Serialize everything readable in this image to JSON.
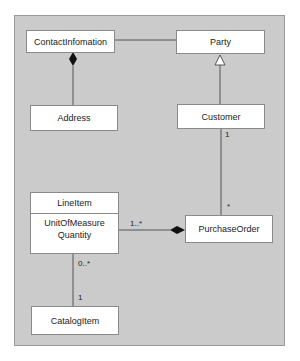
{
  "diagram": {
    "type": "UML class diagram",
    "classes": [
      {
        "id": "contact",
        "name": "ContactInfomation",
        "attributes": []
      },
      {
        "id": "party",
        "name": "Party",
        "attributes": []
      },
      {
        "id": "address",
        "name": "Address",
        "attributes": []
      },
      {
        "id": "customer",
        "name": "Customer",
        "attributes": []
      },
      {
        "id": "lineitem",
        "name": "LineItem",
        "attributes": [
          "UnitOfMeasure",
          "Quantity"
        ]
      },
      {
        "id": "purchaseorder",
        "name": "PurchaseOrder",
        "attributes": []
      },
      {
        "id": "catalogitem",
        "name": "CatalogItem",
        "attributes": []
      }
    ],
    "relationships": [
      {
        "from": "ContactInfomation",
        "to": "Party",
        "kind": "association"
      },
      {
        "from": "Address",
        "to": "ContactInfomation",
        "kind": "composition"
      },
      {
        "from": "Customer",
        "to": "Party",
        "kind": "generalization"
      },
      {
        "from": "Customer",
        "to": "PurchaseOrder",
        "kind": "association",
        "from_mult": "1",
        "to_mult": "*"
      },
      {
        "from": "LineItem",
        "to": "PurchaseOrder",
        "kind": "composition",
        "from_mult": "1..*"
      },
      {
        "from": "LineItem",
        "to": "CatalogItem",
        "kind": "association",
        "from_mult": "0..*",
        "to_mult": "1"
      }
    ],
    "labels": {
      "customer_mult": "1",
      "po_mult": "*",
      "lineitem_po_mult": "1..*",
      "lineitem_catalog_mult": "0..*",
      "catalog_mult": "1"
    },
    "colors": {
      "background": "#cbcbcb",
      "frame_border": "#9a9a9a",
      "box_fill": "#ffffff",
      "line": "#555555"
    }
  }
}
